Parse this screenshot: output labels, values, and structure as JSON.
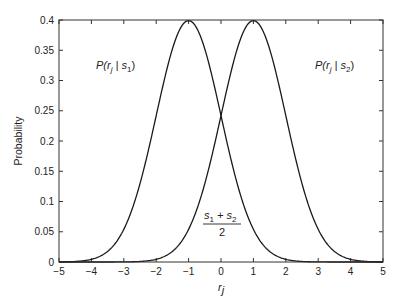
{
  "chart_data": {
    "type": "line",
    "title": "",
    "xlabel": "r_j",
    "ylabel": "Probability",
    "xlim": [
      -5,
      5
    ],
    "ylim": [
      0,
      0.4
    ],
    "grid": false,
    "xticks": [
      -5,
      -4,
      -3,
      -2,
      -1,
      0,
      1,
      2,
      3,
      4,
      5
    ],
    "yticks": [
      0,
      0.05,
      0.1,
      0.15,
      0.2,
      0.25,
      0.3,
      0.35,
      0.4
    ],
    "xtick_labels": [
      "−5",
      "−4",
      "−3",
      "−2",
      "−1",
      "0",
      "1",
      "2",
      "3",
      "4",
      "5"
    ],
    "ytick_labels": [
      "0",
      "0.05",
      "0.1",
      "0.15",
      "0.2",
      "0.25",
      "0.3",
      "0.35",
      "0.4"
    ],
    "series": [
      {
        "name": "P(r_j | s_1)",
        "distribution": "normal",
        "mean": -1,
        "std": 1,
        "x": [
          -5,
          -4.5,
          -4,
          -3.5,
          -3,
          -2.5,
          -2,
          -1.5,
          -1,
          -0.5,
          0,
          0.5,
          1,
          1.5,
          2,
          2.5,
          3,
          3.5,
          4,
          4.5,
          5
        ],
        "y": [
          0.0001,
          0.0009,
          0.0044,
          0.0175,
          0.054,
          0.1295,
          0.242,
          0.3521,
          0.3989,
          0.3521,
          0.242,
          0.1295,
          0.054,
          0.0175,
          0.0044,
          0.0009,
          0.0001,
          0.0,
          0.0,
          0.0,
          0.0
        ]
      },
      {
        "name": "P(r_j | s_2)",
        "distribution": "normal",
        "mean": 1,
        "std": 1,
        "x": [
          -5,
          -4.5,
          -4,
          -3.5,
          -3,
          -2.5,
          -2,
          -1.5,
          -1,
          -0.5,
          0,
          0.5,
          1,
          1.5,
          2,
          2.5,
          3,
          3.5,
          4,
          4.5,
          5
        ],
        "y": [
          0.0,
          0.0,
          0.0,
          0.0,
          0.0001,
          0.0009,
          0.0044,
          0.0175,
          0.054,
          0.1295,
          0.242,
          0.3521,
          0.3989,
          0.3521,
          0.242,
          0.1295,
          0.054,
          0.0175,
          0.0044,
          0.0009,
          0.0001
        ]
      }
    ],
    "annotations": [
      {
        "text": "P(r_j | s_1)",
        "x": -3,
        "y": 0.34
      },
      {
        "text": "P(r_j | s_2)",
        "x": 3,
        "y": 0.34
      },
      {
        "text": "(s_1 + s_2) / 2",
        "x": 0,
        "y": 0.05
      }
    ],
    "labels": {
      "ylabel": "Probability",
      "xlabel_main": "r",
      "xlabel_sub": "j",
      "ann1": {
        "P": "P(r",
        "sub": "j",
        "bar": " | s",
        "sub2": "1",
        "close": ")"
      },
      "ann2": {
        "P": "P(r",
        "sub": "j",
        "bar": " | s",
        "sub2": "2",
        "close": ")"
      },
      "frac": {
        "num_s1": "s",
        "num_sub1": "1",
        "plus": " + s",
        "num_sub2": "2",
        "den": "2"
      }
    }
  }
}
